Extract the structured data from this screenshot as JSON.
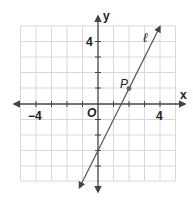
{
  "graph": {
    "x_axis_label": "x",
    "y_axis_label": "y",
    "origin_label": "O",
    "x_tick_labels": [
      {
        "value": -4,
        "text": "−4"
      },
      {
        "value": 4,
        "text": "4"
      }
    ],
    "y_tick_labels": [
      {
        "value": 4,
        "text": "4"
      }
    ],
    "line_label": "ℓ",
    "point_label": "P",
    "grid_range": {
      "xmin": -5,
      "xmax": 5,
      "ymin": -5,
      "ymax": 5
    },
    "line": {
      "slope": 2,
      "y_intercept": -3,
      "equation": "y = 2x - 3"
    },
    "point": {
      "x": 2,
      "y": 1
    },
    "colors": {
      "grid": "#d8d8d8",
      "axis": "#444444",
      "line": "#555555",
      "point": "#666666"
    }
  }
}
